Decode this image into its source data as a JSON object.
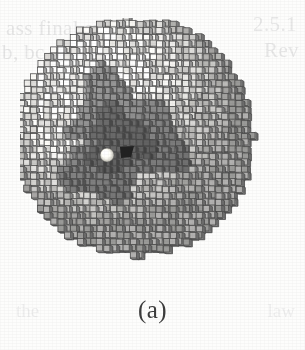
{
  "figure": {
    "caption": "(a)",
    "kind": "voxel-rendered sphere",
    "background_color": "#fdfdfc"
  },
  "bleed_through": {
    "top_left_line1": "ass final sys",
    "top_left_line2": "b, bc to",
    "top_right_line1": "2.5.1",
    "top_right_line2": "Rev",
    "bottom_left": "the",
    "bottom_right": "law"
  },
  "sphere": {
    "center_x": 133,
    "center_y": 136,
    "radius_px": 131,
    "voxel_size_px": 6.6,
    "projection": "axonometric-cube",
    "outer_shell_color": "#c9c9c9",
    "outer_shell_highlight_color": "#f2f1ee",
    "core_color": "#6e6e6e",
    "core_dark_color": "#4e4e4e",
    "edge_color": "#3a3a3a",
    "core_radius_px": 58,
    "core_center_x": 118,
    "core_center_y": 140
  },
  "markers": {
    "bright_particle": {
      "label": "bright-particle",
      "x": 107,
      "y": 155,
      "radius_px": 7,
      "color": "#fbfaf3"
    },
    "dark_cavity": {
      "label": "dark-cavity",
      "x": 127,
      "y": 152,
      "width_px": 14,
      "height_px": 10,
      "color": "#131313"
    }
  },
  "palette": {
    "ink": "#3b3b3b",
    "paper": "#fdfdfc",
    "light_voxel": "#efeeea",
    "mid_voxel": "#b4b4b4",
    "dark_voxel": "#6d6d6d",
    "darkest_voxel": "#4a4a4a"
  }
}
